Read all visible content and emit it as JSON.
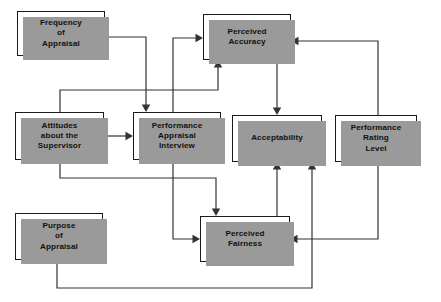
{
  "diagram": {
    "canvas": {
      "width": 441,
      "height": 302
    },
    "colors": {
      "node_fill": "#ffffff",
      "node_border": "#1a1a1a",
      "node_shadow": "#9a9a9a",
      "edge": "#333333",
      "background": "#ffffff"
    },
    "nodes": [
      {
        "id": "frequency_of_appraisal",
        "label": "Frequency\nof\nAppraisal",
        "x": 17,
        "y": 11,
        "w": 88,
        "h": 45
      },
      {
        "id": "perceived_accuracy",
        "label": "Perceived\nAccuracy",
        "x": 203,
        "y": 14,
        "w": 88,
        "h": 46
      },
      {
        "id": "attitudes_about_the_supervisor",
        "label": "Attitudes\nabout the\nSupervisor",
        "x": 15,
        "y": 112,
        "w": 89,
        "h": 48
      },
      {
        "id": "performance_appraisal_interview",
        "label": "Performance\nAppraisal\nInterview",
        "x": 133,
        "y": 112,
        "w": 88,
        "h": 48
      },
      {
        "id": "acceptability",
        "label": "Acceptability",
        "x": 232,
        "y": 115,
        "w": 90,
        "h": 47
      },
      {
        "id": "performance_rating_level",
        "label": "Performance\nRating\nLevel",
        "x": 335,
        "y": 115,
        "w": 82,
        "h": 47
      },
      {
        "id": "purpose_of_appraisal",
        "label": "Purpose\nof\nAppraisal",
        "x": 15,
        "y": 213,
        "w": 88,
        "h": 47
      },
      {
        "id": "perceived_fairness",
        "label": "Perceived\nFairness",
        "x": 200,
        "y": 216,
        "w": 90,
        "h": 46
      }
    ],
    "edges": [
      {
        "id": "frequency-to-interview",
        "from": "frequency_of_appraisal",
        "to": "performance_appraisal_interview",
        "path": "M 105 37 L 146 37 L 146 106",
        "arrow_at": [
          146,
          112
        ],
        "arrow_dir": "down"
      },
      {
        "id": "interview-to-accuracy-left",
        "from": "performance_appraisal_interview",
        "to": "perceived_accuracy",
        "path": "M 173 112 L 173 38 L 197 38",
        "arrow_at": [
          203,
          38
        ],
        "arrow_dir": "right"
      },
      {
        "id": "attitudes-to-accuracy-bottom",
        "from": "attitudes_about_the_supervisor",
        "to": "perceived_accuracy",
        "path": "M 60 112 L 60 90 L 218 90 L 218 66",
        "arrow_at": [
          218,
          60
        ],
        "arrow_dir": "up"
      },
      {
        "id": "attitudes-to-interview",
        "from": "attitudes_about_the_supervisor",
        "to": "performance_appraisal_interview",
        "path": "M 104 136 L 127 136",
        "arrow_at": [
          133,
          136
        ],
        "arrow_dir": "right"
      },
      {
        "id": "attitudes-to-fairness-top",
        "from": "attitudes_about_the_supervisor",
        "to": "perceived_fairness",
        "path": "M 60 160 L 60 178 L 216 178 L 216 210",
        "arrow_at": [
          216,
          216
        ],
        "arrow_dir": "down"
      },
      {
        "id": "interview-to-fairness-left",
        "from": "performance_appraisal_interview",
        "to": "perceived_fairness",
        "path": "M 173 160 L 173 239 L 194 239",
        "arrow_at": [
          200,
          239
        ],
        "arrow_dir": "right"
      },
      {
        "id": "accuracy-to-acceptability",
        "from": "perceived_accuracy",
        "to": "acceptability",
        "path": "M 277 60 L 277 109",
        "arrow_at": [
          277,
          115
        ],
        "arrow_dir": "down"
      },
      {
        "id": "rating-to-accuracy-right",
        "from": "performance_rating_level",
        "to": "perceived_accuracy",
        "path": "M 378 115 L 378 41 L 297 41",
        "arrow_at": [
          291,
          41
        ],
        "arrow_dir": "left"
      },
      {
        "id": "rating-to-fairness-right",
        "from": "performance_rating_level",
        "to": "perceived_fairness",
        "path": "M 378 162 L 378 239 L 296 239",
        "arrow_at": [
          290,
          239
        ],
        "arrow_dir": "left"
      },
      {
        "id": "fairness-to-acceptability",
        "from": "perceived_fairness",
        "to": "acceptability",
        "path": "M 277 216 L 277 168",
        "arrow_at": [
          277,
          162
        ],
        "arrow_dir": "up"
      },
      {
        "id": "purpose-to-acceptability",
        "from": "purpose_of_appraisal",
        "to": "acceptability",
        "path": "M 57 260 L 57 288 L 312 288 L 312 168",
        "arrow_at": [
          312,
          162
        ],
        "arrow_dir": "up"
      }
    ]
  }
}
